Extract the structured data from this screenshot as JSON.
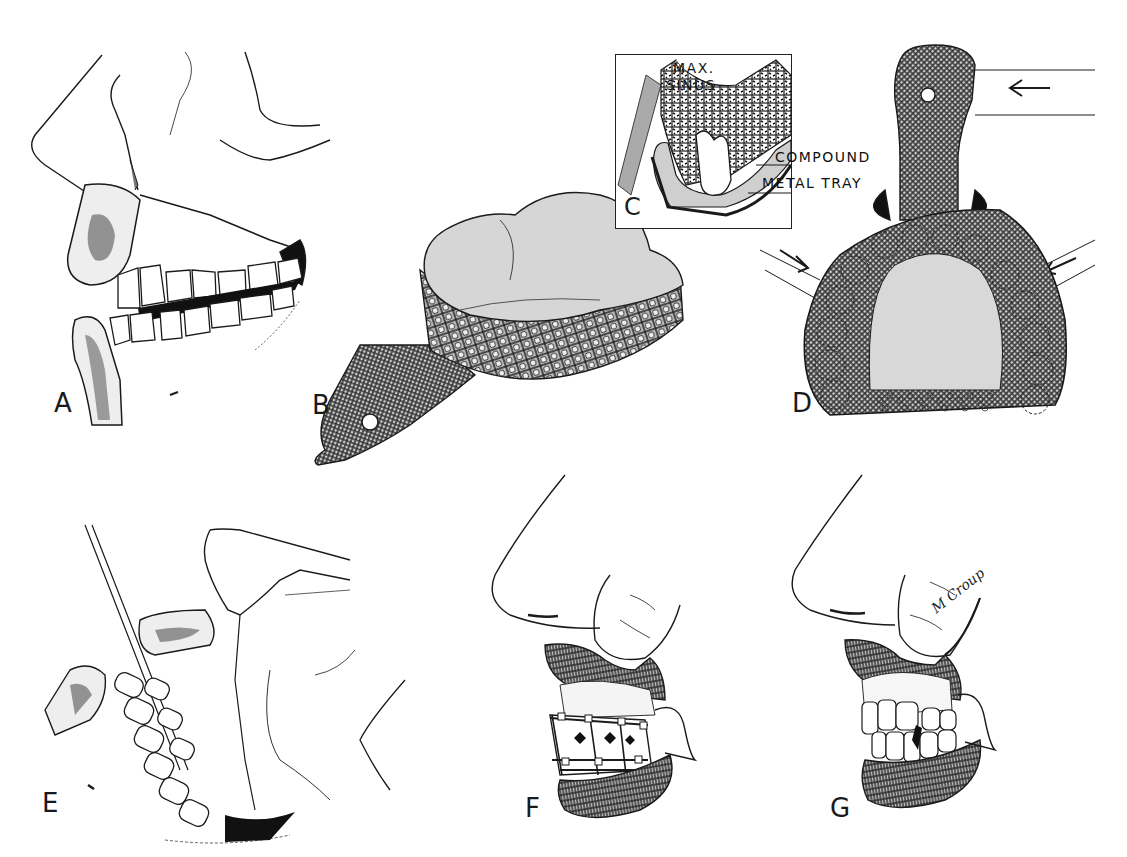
{
  "figure": {
    "style": "black-and-white medical line illustration, dental/maxillofacial",
    "colors": {
      "background": "#ffffff",
      "ink": "#111111",
      "tray_fill": "#c9c9c9",
      "compound_fill": "#d4d4d4"
    },
    "panels": [
      {
        "id": "A",
        "label": "A",
        "description": "lateral skull profile with maxillary fracture line and occlusion"
      },
      {
        "id": "B",
        "label": "B",
        "description": "perforated metal impression tray filled with compound"
      },
      {
        "id": "C",
        "label": "C",
        "description": "inset cross-section of maxilla with tray",
        "annotations": {
          "sinus": "MAX.\nSINUS",
          "sinus_line1": "MAX.",
          "sinus_line2": "SINUS",
          "compound": "COMPOUND",
          "tray": "METAL TRAY"
        }
      },
      {
        "id": "D",
        "label": "D",
        "description": "occlusal view of tray seated on maxillary arch with arrows"
      },
      {
        "id": "E",
        "label": "E",
        "description": "lateral profile with wire fixation along dentition"
      },
      {
        "id": "F",
        "label": "F",
        "description": "lip retracted showing splint bar on teeth"
      },
      {
        "id": "G",
        "label": "G",
        "description": "lip retracted showing restored occlusion"
      }
    ],
    "signature": "M Croup"
  }
}
